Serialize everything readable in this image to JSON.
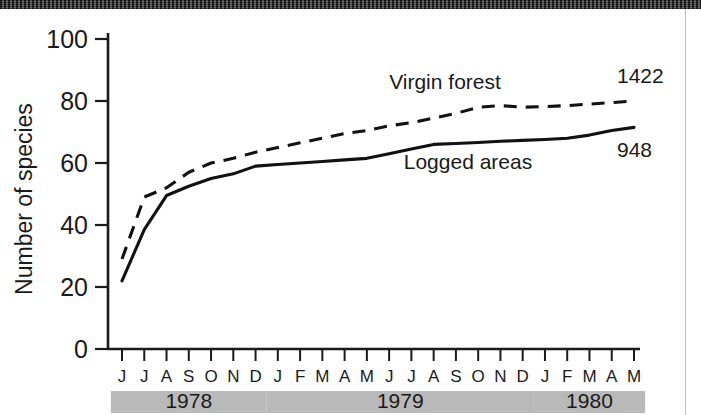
{
  "chart_data": {
    "type": "line",
    "title": "",
    "xlabel": "",
    "ylabel": "Number of species",
    "ylim": [
      0,
      100
    ],
    "yticks": [
      "0",
      "20",
      "40",
      "60",
      "80",
      "100"
    ],
    "grid": false,
    "legend_position": "inline-annotations",
    "x": [
      "J",
      "J",
      "A",
      "S",
      "O",
      "N",
      "D",
      "J",
      "F",
      "M",
      "A",
      "M",
      "J",
      "J",
      "A",
      "S",
      "O",
      "N",
      "D",
      "J",
      "F",
      "M",
      "A",
      "M"
    ],
    "x_groups": [
      {
        "label": "1978",
        "months": [
          "J",
          "J",
          "A",
          "S",
          "O",
          "N",
          "D"
        ]
      },
      {
        "label": "1979",
        "months": [
          "J",
          "F",
          "M",
          "A",
          "M",
          "J",
          "J",
          "A",
          "S",
          "O",
          "N",
          "D"
        ]
      },
      {
        "label": "1980",
        "months": [
          "J",
          "F",
          "M",
          "A",
          "M"
        ]
      }
    ],
    "series": [
      {
        "name": "Virgin forest",
        "style": "dashed",
        "endpoint_label": "1422",
        "values": [
          29,
          49,
          52,
          57,
          60,
          61.5,
          63.5,
          65,
          66.5,
          68,
          69.5,
          70.5,
          72,
          73,
          74.5,
          76,
          78,
          78.5,
          78,
          78.2,
          78.5,
          79,
          79.5,
          80
        ]
      },
      {
        "name": "Logged areas",
        "style": "solid",
        "endpoint_label": "948",
        "values": [
          22,
          38.5,
          49.5,
          52.5,
          55,
          56.5,
          59,
          59.5,
          60,
          60.5,
          61,
          61.5,
          63,
          64.5,
          66,
          66.3,
          66.6,
          67,
          67.3,
          67.6,
          68,
          69,
          70.5,
          71.5
        ]
      }
    ],
    "annotations": [
      {
        "text": "Virgin forest",
        "series": "Virgin forest"
      },
      {
        "text": "Logged areas",
        "series": "Logged areas"
      },
      {
        "text": "1422",
        "series": "Virgin forest",
        "role": "endpoint"
      },
      {
        "text": "948",
        "series": "Logged areas",
        "role": "endpoint"
      }
    ]
  },
  "colors": {
    "ink": "#1a1a1a",
    "line": "#111111",
    "year_band": "#b9b9b9",
    "scan_bar": "#4a4a4a",
    "background": "#ffffff"
  }
}
